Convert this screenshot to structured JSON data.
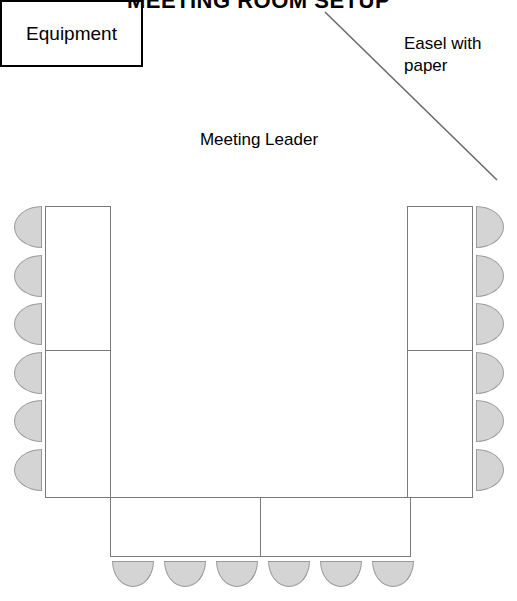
{
  "title": "MEETING ROOM SETUP",
  "labels": {
    "easel": "Easel with\npaper",
    "meeting_leader": "Meeting Leader",
    "equipment": "Equipment"
  },
  "colors": {
    "chair_fill": "#d4d4d4",
    "chair_stroke": "#9a9a9a",
    "table_stroke": "#7a7a7a",
    "equipment_stroke": "#000000",
    "easel_line": "#6b6b6b",
    "text": "#000000",
    "background": "#ffffff"
  },
  "layout": {
    "width": 517,
    "height": 601,
    "arrangement": "u-shape"
  },
  "easel": {
    "line": {
      "x1": 7,
      "y1": 8,
      "x2": 179,
      "y2": 176
    }
  },
  "tables": [
    {
      "id": "table-left-upper",
      "name": "left-table-upper-segment",
      "x": 45,
      "y": 206,
      "w": 66,
      "h": 145
    },
    {
      "id": "table-left-lower",
      "name": "left-table-lower-segment",
      "x": 45,
      "y": 350,
      "w": 66,
      "h": 148
    },
    {
      "id": "table-right-upper",
      "name": "right-table-upper-segment",
      "x": 407,
      "y": 206,
      "w": 66,
      "h": 145
    },
    {
      "id": "table-right-lower",
      "name": "right-table-lower-segment",
      "x": 407,
      "y": 350,
      "w": 66,
      "h": 148
    },
    {
      "id": "table-bottom-left",
      "name": "bottom-table-left-segment",
      "x": 110,
      "y": 497,
      "w": 151,
      "h": 60
    },
    {
      "id": "table-bottom-right",
      "name": "bottom-table-right-segment",
      "x": 260,
      "y": 497,
      "w": 151,
      "h": 60
    }
  ],
  "chairs": {
    "left_count": 6,
    "right_count": 6,
    "bottom_count": 6,
    "total": 18,
    "left": [
      {
        "x": 14,
        "y": 206
      },
      {
        "x": 14,
        "y": 255
      },
      {
        "x": 14,
        "y": 303
      },
      {
        "x": 14,
        "y": 352
      },
      {
        "x": 14,
        "y": 400
      },
      {
        "x": 14,
        "y": 449
      }
    ],
    "right": [
      {
        "x": 476,
        "y": 206
      },
      {
        "x": 476,
        "y": 255
      },
      {
        "x": 476,
        "y": 303
      },
      {
        "x": 476,
        "y": 352
      },
      {
        "x": 476,
        "y": 400
      },
      {
        "x": 476,
        "y": 449
      }
    ],
    "bottom": [
      {
        "x": 112,
        "y": 561
      },
      {
        "x": 164,
        "y": 561
      },
      {
        "x": 216,
        "y": 561
      },
      {
        "x": 268,
        "y": 561
      },
      {
        "x": 320,
        "y": 561
      },
      {
        "x": 372,
        "y": 561
      }
    ]
  }
}
